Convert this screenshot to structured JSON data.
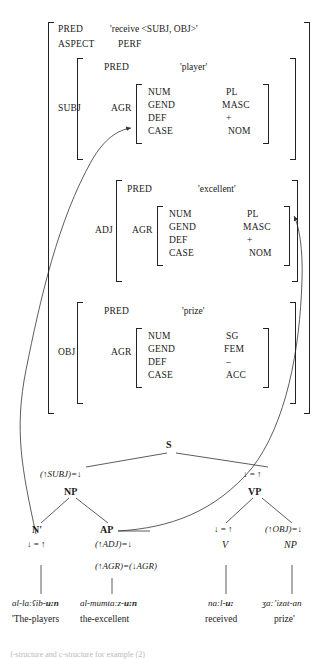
{
  "figure": {
    "type": "lfg-analysis",
    "caption": "f-structure and c-structure for example (2)"
  },
  "fstructure": {
    "top": [
      {
        "attribute": "PRED",
        "value": "'receive <SUBJ, OBJ>'"
      },
      {
        "attribute": "ASPECT",
        "value": "PERF"
      }
    ],
    "subj": {
      "label": "SUBJ",
      "pred_attr": "PRED",
      "pred_value": "'player'",
      "agr_label": "AGR",
      "agr": [
        {
          "attribute": "NUM",
          "value": "PL"
        },
        {
          "attribute": "GEND",
          "value": "MASC"
        },
        {
          "attribute": "DEF",
          "value": "+"
        },
        {
          "attribute": "CASE",
          "value": "NOM"
        }
      ]
    },
    "adj": {
      "label": "ADJ",
      "pred_attr": "PRED",
      "pred_value": "'excellent'",
      "agr_label": "AGR",
      "agr": [
        {
          "attribute": "NUM",
          "value": "PL"
        },
        {
          "attribute": "GEND",
          "value": "MASC"
        },
        {
          "attribute": "DEF",
          "value": "+"
        },
        {
          "attribute": "CASE",
          "value": "NOM"
        }
      ]
    },
    "obj": {
      "label": "OBJ",
      "pred_attr": "PRED",
      "pred_value": "'prize'",
      "agr_label": "AGR",
      "agr": [
        {
          "attribute": "NUM",
          "value": "SG"
        },
        {
          "attribute": "GEND",
          "value": "FEM"
        },
        {
          "attribute": "DEF",
          "value": "–"
        },
        {
          "attribute": "CASE",
          "value": "ACC"
        }
      ]
    }
  },
  "cstructure": {
    "root": "S",
    "nodes": {
      "np_subj": {
        "annotation": "(↑SUBJ)=↓",
        "category": "NP"
      },
      "vp": {
        "annotation": "↓ = ↑",
        "category": "VP"
      },
      "nbar": {
        "category": "N'",
        "annotation": "↓ = ↑"
      },
      "ap": {
        "category": "AP",
        "annotation1": "(↑ADJ)=↓",
        "annotation2": "(↑AGR)=(↓AGR)"
      },
      "v": {
        "annotation": "↓ = ↑",
        "category": "V"
      },
      "np_obj": {
        "annotation": "(↑OBJ)=↓",
        "category": "NP"
      }
    }
  },
  "lexical": {
    "items": [
      {
        "form_pre": "al-la:ʕib-",
        "form_bold": "u:n",
        "gloss": "'The-players"
      },
      {
        "form_pre": "al-mumta:z-",
        "form_bold": "u:n",
        "gloss": "the-excellent"
      },
      {
        "form_pre": "na:l-",
        "form_bold": "u:",
        "gloss": "received"
      },
      {
        "form_pre": "ʒa:ʼizat-an",
        "form_bold": "",
        "gloss": "prize'"
      }
    ]
  }
}
